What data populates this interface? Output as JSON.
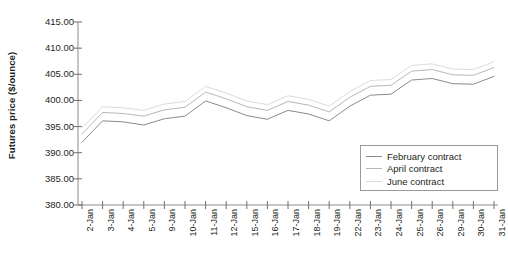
{
  "chart_data": {
    "type": "line",
    "title": "",
    "xlabel": "",
    "ylabel": "Futures price ($/ounce)",
    "ylim": [
      380.0,
      415.0
    ],
    "yticks": [
      "415.00",
      "410.00",
      "405.00",
      "400.00",
      "395.00",
      "390.00",
      "385.00",
      "380.00"
    ],
    "ytick_values": [
      415,
      410,
      405,
      400,
      395,
      390,
      385,
      380
    ],
    "grid": false,
    "legend_position": "bottom-right",
    "categories": [
      "2-Jan",
      "3-Jan",
      "4-Jan",
      "5-Jan",
      "9-Jan",
      "10-Jan",
      "11-Jan",
      "12-Jan",
      "15-Jan",
      "16-Jan",
      "17-Jan",
      "18-Jan",
      "19-Jan",
      "22-Jan",
      "23-Jan",
      "24-Jan",
      "25-Jan",
      "26-Jan",
      "29-Jan",
      "30-Jan",
      "31-Jan"
    ],
    "series": [
      {
        "name": "February contract",
        "color": "#8c8c8c",
        "values": [
          392.0,
          396.1,
          395.9,
          395.3,
          396.5,
          397.0,
          399.9,
          398.6,
          397.1,
          396.4,
          398.1,
          397.4,
          396.1,
          398.9,
          401.0,
          401.2,
          403.9,
          404.2,
          403.2,
          403.1,
          404.6
        ]
      },
      {
        "name": "April contract",
        "color": "#b7b7b7",
        "values": [
          393.6,
          397.7,
          397.5,
          397.0,
          398.2,
          398.7,
          401.6,
          400.3,
          398.8,
          398.1,
          399.8,
          399.1,
          397.8,
          400.6,
          402.7,
          402.9,
          405.6,
          405.9,
          404.9,
          404.8,
          406.3
        ]
      },
      {
        "name": "June contract",
        "color": "#dcdcdc",
        "values": [
          394.7,
          398.8,
          398.6,
          398.1,
          399.3,
          399.8,
          402.7,
          401.4,
          399.9,
          399.2,
          400.9,
          400.2,
          398.9,
          401.7,
          403.8,
          404.0,
          406.7,
          407.0,
          406.0,
          405.9,
          407.4
        ]
      }
    ]
  },
  "legend": {
    "items": [
      {
        "label": "February contract"
      },
      {
        "label": "April contract"
      },
      {
        "label": "June contract"
      }
    ]
  },
  "axis": {
    "axis_color": "#8b8b8b",
    "tick_color": "#6f6f6f"
  }
}
